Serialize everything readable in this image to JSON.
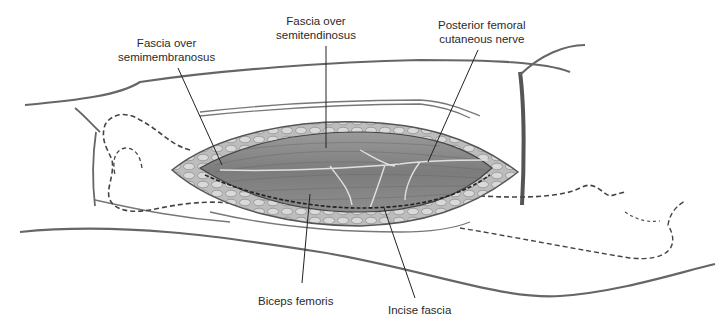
{
  "figure": {
    "type": "anatomical-surgical-illustration",
    "labels": {
      "semimembranosus": {
        "line1": "Fascia over",
        "line2": "semimembranosus"
      },
      "semitendinosus": {
        "line1": "Fascia over",
        "line2": "semitendinosus"
      },
      "nerve": {
        "line1": "Posterior femoral",
        "line2": "cutaneous nerve"
      },
      "biceps": {
        "line1": "Biceps femoris"
      },
      "incise": {
        "line1": "Incise fascia"
      }
    },
    "colors": {
      "outline": "#5a5a5a",
      "muscle": "#8c8c8c",
      "fat": "#c9c9c9",
      "text": "#2a2a2a"
    }
  }
}
